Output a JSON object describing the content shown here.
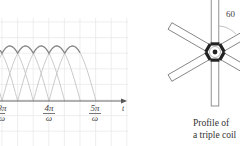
{
  "figure": {
    "left_panel": {
      "description": "Overlapping half-sine arches with dark envelope (rectified multi-phase output)",
      "axis_label": "t",
      "ticks": [
        {
          "num": "3π",
          "den": "ω"
        },
        {
          "num": "4π",
          "den": "ω"
        },
        {
          "num": "5π",
          "den": "ω"
        }
      ],
      "colors": {
        "grid": "#e6e6e6",
        "arch": "#c4c4c4",
        "envelope": "#8a8a8a",
        "axis": "#555555"
      }
    },
    "right_panel": {
      "angle_label": "60",
      "caption_line1": "Profile of",
      "caption_line2": "a triple coil",
      "colors": {
        "spoke_stroke": "#777777",
        "core": "#222222"
      }
    }
  },
  "chart_data": {
    "type": "line",
    "title": "",
    "xlabel": "t",
    "ylabel": "",
    "x_tick_labels": [
      "3π/ω",
      "4π/ω",
      "5π/ω"
    ],
    "series": [
      {
        "name": "phase arches",
        "shape": "|sin| half-waves, period π/ω, phase-shifted by π/(3ω)"
      },
      {
        "name": "envelope",
        "shape": "maximum of phase arches (ripple near peak)"
      }
    ],
    "grid": true
  }
}
